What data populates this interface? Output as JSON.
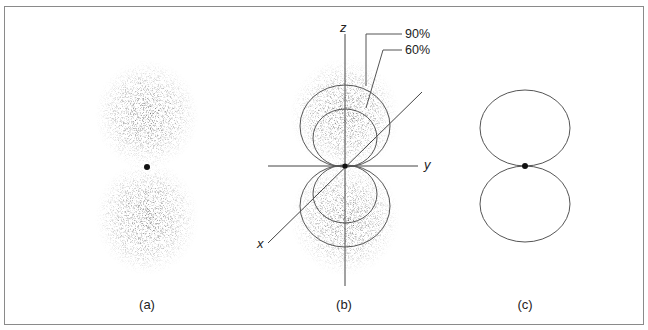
{
  "figure": {
    "panels": [
      {
        "id": "a",
        "caption": "(a)",
        "description": "electron probability dot cloud of p orbital"
      },
      {
        "id": "b",
        "caption": "(b)",
        "description": "dot cloud with 90% and 60% probability boundary contours on xyz axes"
      },
      {
        "id": "c",
        "caption": "(c)",
        "description": "boundary surface outline of p orbital"
      }
    ],
    "axes": {
      "x": "x",
      "y": "y",
      "z": "z"
    },
    "contours": [
      {
        "label": "90%"
      },
      {
        "label": "60%"
      }
    ],
    "colors": {
      "ink": "#222222",
      "line": "#555555",
      "frame": "#8a8a8a",
      "background": "#ffffff"
    }
  }
}
